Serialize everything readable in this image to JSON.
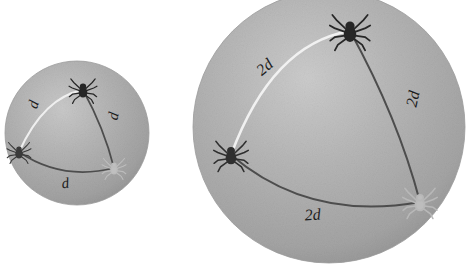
{
  "figure": {
    "background_color": "#ffffff",
    "sphere_fill_color": "#a9a9a9",
    "sphere_shadow_color": "#8f8f8f",
    "sphere_highlight_color": "#c4c4c4",
    "arc_dark_color": "#4a4a4a",
    "arc_light_color": "#ececec",
    "label_color": "#1c1c1c",
    "spider_dark_color": "#2b2b2b",
    "spider_light_color": "#b9b9b9"
  },
  "spheres": [
    {
      "id": "small-sphere",
      "name": "small-sphere",
      "center_x": 77,
      "center_y": 133,
      "radius": 72,
      "edge_label": "d",
      "edges": [
        {
          "name": "upper-left-edge",
          "label": "d",
          "label_x": 38,
          "label_y": 106,
          "label_rotation": -72,
          "style": "light"
        },
        {
          "name": "right-edge",
          "label": "d",
          "label_x": 118,
          "label_y": 117,
          "label_rotation": -78,
          "style": "dark"
        },
        {
          "name": "bottom-edge",
          "label": "d",
          "label_x": 66,
          "label_y": 188,
          "label_rotation": -8,
          "style": "dark"
        }
      ],
      "spiders": [
        {
          "name": "spider-top",
          "x": 83,
          "y": 90,
          "size": 15,
          "shade": "dark"
        },
        {
          "name": "spider-left",
          "x": 19,
          "y": 152,
          "size": 13,
          "shade": "dark"
        },
        {
          "name": "spider-bottom-right",
          "x": 114,
          "y": 168,
          "size": 13,
          "shade": "light"
        }
      ]
    },
    {
      "id": "large-sphere",
      "name": "large-sphere",
      "center_x": 329,
      "center_y": 127,
      "radius": 136,
      "edge_label": "2d",
      "edges": [
        {
          "name": "upper-left-edge",
          "label": "2d",
          "label_x": 268,
          "label_y": 71,
          "label_rotation": -40,
          "style": "light"
        },
        {
          "name": "right-edge",
          "label": "2d",
          "label_x": 418,
          "label_y": 100,
          "label_rotation": -78,
          "style": "dark"
        },
        {
          "name": "bottom-edge",
          "label": "2d",
          "label_x": 313,
          "label_y": 220,
          "label_rotation": -4,
          "style": "dark"
        }
      ],
      "spiders": [
        {
          "name": "spider-top",
          "x": 350,
          "y": 31,
          "size": 22,
          "shade": "dark"
        },
        {
          "name": "spider-left",
          "x": 231,
          "y": 155,
          "size": 19,
          "shade": "dark"
        },
        {
          "name": "spider-bottom-right",
          "x": 420,
          "y": 202,
          "size": 19,
          "shade": "light"
        }
      ]
    }
  ]
}
